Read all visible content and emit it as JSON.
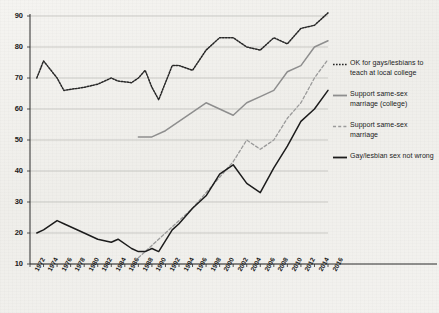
{
  "chart_data": {
    "type": "line",
    "title": "",
    "subtitle": "",
    "xlabel": "",
    "ylabel": "",
    "xlim": [
      1972,
      2016
    ],
    "ylim": [
      10,
      90
    ],
    "ytick_step": 10,
    "xtick_step": 2,
    "grid": true,
    "legend_position": "right",
    "xticks": [
      "1972",
      "1974",
      "1976",
      "1978",
      "1980",
      "1982",
      "1984",
      "1986",
      "1988",
      "1990",
      "1992",
      "1994",
      "1996",
      "1998",
      "2000",
      "2002",
      "2004",
      "2006",
      "2008",
      "2010",
      "2012",
      "2014",
      "2016"
    ],
    "yticks": [
      "10",
      "20",
      "30",
      "40",
      "50",
      "60",
      "70",
      "80",
      "90"
    ],
    "series": [
      {
        "name": "OK for gays/lesbians to teach at local college",
        "style": "dotted",
        "color": "#262626",
        "x": [
          1973,
          1974,
          1976,
          1977,
          1980,
          1982,
          1984,
          1985,
          1987,
          1988,
          1989,
          1990,
          1991,
          1993,
          1994,
          1996,
          1998,
          2000,
          2002,
          2004,
          2006,
          2008,
          2010,
          2012,
          2014,
          2016
        ],
        "values": [
          70,
          75.5,
          70,
          66,
          67,
          68,
          70,
          69,
          68.5,
          70,
          72.5,
          67,
          63,
          74,
          74,
          72.5,
          79,
          83,
          83,
          80,
          79,
          83,
          81,
          86,
          87,
          91
        ]
      },
      {
        "name": "Support same-sex marriage (college)",
        "style": "solid",
        "color": "#8e8e8e",
        "x": [
          1988,
          1990,
          1992,
          1994,
          1996,
          1998,
          2000,
          2002,
          2004,
          2006,
          2008,
          2010,
          2012,
          2014,
          2016
        ],
        "values": [
          51,
          51,
          53,
          56,
          59,
          62,
          60,
          58,
          62,
          64,
          66,
          72,
          74,
          80,
          82
        ]
      },
      {
        "name": "Support same-sex marriage",
        "style": "dashed",
        "color": "#9a9a9a",
        "x": [
          1988,
          1990,
          1992,
          1994,
          1996,
          1998,
          2000,
          2002,
          2004,
          2006,
          2008,
          2010,
          2012,
          2014,
          2016
        ],
        "values": [
          12,
          16,
          20,
          24,
          28,
          33,
          38,
          43,
          50,
          47,
          50,
          57,
          62,
          70,
          76
        ]
      },
      {
        "name": "Gay/lesbian sex not wrong",
        "style": "solid",
        "color": "#1c1c1c",
        "x": [
          1973,
          1974,
          1976,
          1977,
          1980,
          1982,
          1984,
          1985,
          1987,
          1988,
          1989,
          1990,
          1991,
          1993,
          1994,
          1996,
          1998,
          2000,
          2002,
          2004,
          2006,
          2008,
          2010,
          2012,
          2014,
          2016
        ],
        "values": [
          20,
          21,
          24,
          23,
          20,
          18,
          17,
          18,
          15,
          14,
          14,
          15,
          14,
          21,
          23,
          28,
          32,
          39,
          42,
          36,
          33,
          41,
          48,
          56,
          60,
          66
        ]
      }
    ]
  },
  "legend": {
    "entries": [
      {
        "label": "OK for gays/lesbians to teach at local college",
        "style": "dotted",
        "color": "#262626"
      },
      {
        "label": "Support same-sex marriage (college)",
        "style": "solid",
        "color": "#8e8e8e"
      },
      {
        "label": "Support same-sex marriage",
        "style": "dashed",
        "color": "#9a9a9a"
      },
      {
        "label": "Gay/lesbian sex not wrong",
        "style": "solid",
        "color": "#1c1c1c"
      }
    ]
  },
  "axes": {
    "axis_color": "#2a2a2a",
    "grid_color": "#b9b9b5"
  }
}
